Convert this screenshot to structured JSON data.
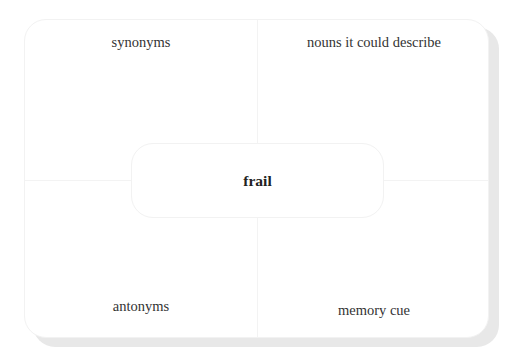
{
  "diagram": {
    "type": "word-map",
    "center_word": "frail",
    "quadrants": {
      "top_left": "synonyms",
      "top_right": "nouns it could describe",
      "bottom_left": "antonyms",
      "bottom_right": "memory cue"
    }
  }
}
